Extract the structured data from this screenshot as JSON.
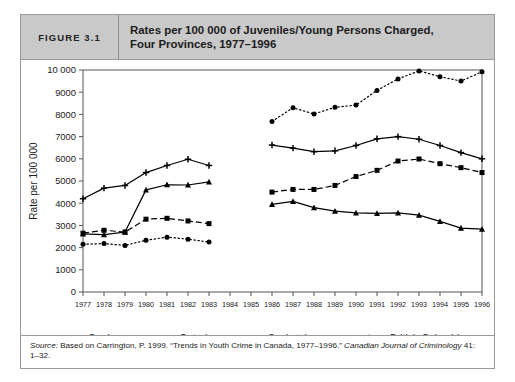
{
  "figure": {
    "number_label": "FIGURE 3.1",
    "title_line1": "Rates per 100 000 of Juveniles/Young Persons Charged,",
    "title_line2": "Four Provinces, 1977–1996"
  },
  "source": {
    "label": "Source:",
    "text": " Based on Carrington, P. 1999. “Trends in Youth Crime in Canada, 1977–1996.” ",
    "journal": "Canadian Journal of Criminology",
    "tail": " 41: 1–32."
  },
  "legend": {
    "position": "bottom-center",
    "items": [
      {
        "label": "Quebec",
        "style": "solid",
        "marker": "triangle",
        "color": "#000000"
      },
      {
        "label": "Ontario",
        "style": "dashed",
        "marker": "square",
        "color": "#000000"
      },
      {
        "label": "Saskatchewan",
        "style": "dotted",
        "marker": "circle",
        "color": "#000000"
      },
      {
        "label": "British Columbia",
        "style": "solid",
        "marker": "plus",
        "color": "#000000"
      }
    ]
  },
  "chart_data": {
    "type": "line",
    "title": "Rates per 100 000 of Juveniles/Young Persons Charged, Four Provinces, 1977–1996",
    "xlabel": "",
    "ylabel": "Rate per 100 000",
    "x": [
      1977,
      1978,
      1979,
      1980,
      1981,
      1982,
      1983,
      1984,
      1985,
      1986,
      1987,
      1988,
      1989,
      1990,
      1991,
      1992,
      1993,
      1994,
      1995,
      1996
    ],
    "xtick_labels": [
      "1977",
      "1978",
      "1979",
      "1980",
      "1981",
      "1982",
      "1983",
      "1984",
      "1985",
      "1986",
      "1987",
      "1988",
      "1989",
      "1990",
      "1991",
      "1992",
      "1993",
      "1994",
      "1995",
      "1996"
    ],
    "ylim": [
      0,
      10000
    ],
    "yticks": [
      0,
      1000,
      2000,
      3000,
      4000,
      5000,
      6000,
      7000,
      8000,
      9000,
      10000
    ],
    "ytick_labels": [
      "0",
      "1000",
      "2000",
      "3000",
      "4000",
      "5000",
      "6000",
      "7000",
      "8000",
      "9000",
      "10 000"
    ],
    "grid": false,
    "note": "Data gap between 1983 and 1986; no values plotted for 1984 and 1985.",
    "series": [
      {
        "name": "Quebec",
        "style": "solid",
        "marker": "triangle",
        "values": [
          2620,
          2580,
          2700,
          4600,
          4830,
          4820,
          4960,
          null,
          null,
          3950,
          4080,
          3800,
          3640,
          3560,
          3540,
          3560,
          3460,
          3180,
          2880,
          2830
        ]
      },
      {
        "name": "Ontario",
        "style": "dashed",
        "marker": "square",
        "values": [
          2650,
          2780,
          2700,
          3280,
          3320,
          3200,
          3080,
          null,
          null,
          4500,
          4620,
          4620,
          4800,
          5200,
          5480,
          5900,
          5990,
          5780,
          5600,
          5380
        ]
      },
      {
        "name": "Saskatchewan",
        "style": "dotted",
        "marker": "circle",
        "values": [
          2150,
          2180,
          2100,
          2330,
          2470,
          2380,
          2250,
          null,
          null,
          7680,
          8300,
          8020,
          8320,
          8420,
          9080,
          9600,
          9960,
          9700,
          9500,
          9920
        ],
        "peak": {
          "year": 1993,
          "value": 9960
        }
      },
      {
        "name": "British Columbia",
        "style": "solid",
        "marker": "plus",
        "values": [
          4200,
          4680,
          4800,
          5380,
          5700,
          5980,
          5700,
          null,
          null,
          6620,
          6480,
          6320,
          6360,
          6600,
          6900,
          7000,
          6880,
          6600,
          6280,
          6000
        ]
      }
    ]
  }
}
